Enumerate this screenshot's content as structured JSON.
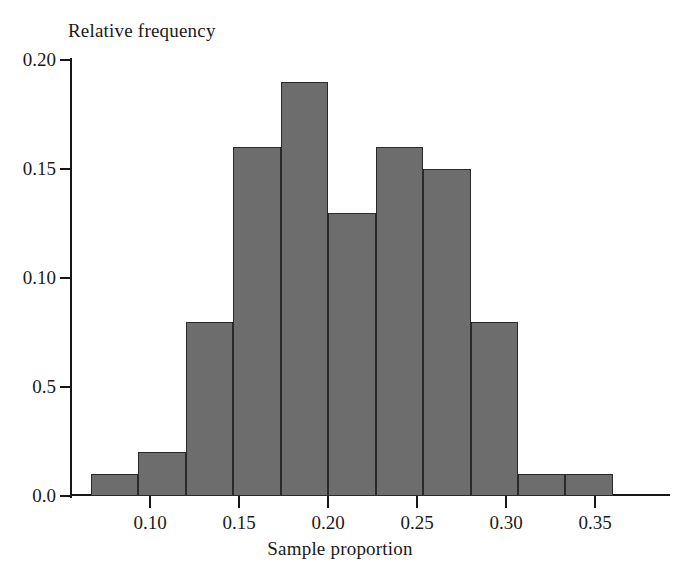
{
  "chart_data": {
    "type": "bar",
    "title": "",
    "xlabel": "Sample proportion",
    "ylabel": "Relative frequency",
    "grid": false,
    "legend": false,
    "xlim": [
      0.055,
      0.392
    ],
    "ylim": [
      0.0,
      0.2
    ],
    "xticks": [
      "0.10",
      "0.15",
      "0.20",
      "0.25",
      "0.30",
      "0.35"
    ],
    "xtick_values": [
      0.1,
      0.15,
      0.2,
      0.25,
      0.3,
      0.35
    ],
    "yticks": [
      "0.20",
      "0.15",
      "0.10",
      "0.5",
      "0.0"
    ],
    "ytick_values": [
      0.2,
      0.15,
      0.1,
      0.05,
      0.0
    ],
    "bin_width": 0.0267,
    "bin_edges": [
      0.0667,
      0.0933,
      0.12,
      0.1467,
      0.1733,
      0.2,
      0.2267,
      0.2533,
      0.28,
      0.3067,
      0.3333,
      0.36
    ],
    "categories": [
      "0.067-0.093",
      "0.093-0.120",
      "0.120-0.147",
      "0.147-0.173",
      "0.173-0.200",
      "0.200-0.227",
      "0.227-0.253",
      "0.253-0.280",
      "0.280-0.307",
      "0.307-0.333",
      "0.333-0.360"
    ],
    "values": [
      0.01,
      0.02,
      0.08,
      0.16,
      0.19,
      0.13,
      0.16,
      0.15,
      0.08,
      0.01,
      0.01
    ],
    "bar_color": "#6d6d6d",
    "bar_edge_color": "#2a2a2a",
    "axis_color": "#161616"
  }
}
